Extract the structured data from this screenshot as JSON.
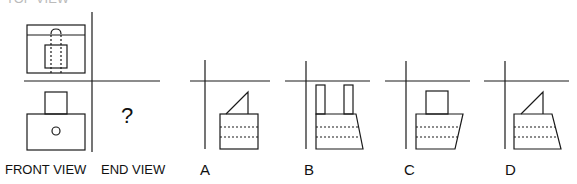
{
  "question": {
    "top_label": "TOP VIEW",
    "front_label": "FRONT VIEW",
    "end_label": "END VIEW",
    "unknown_marker": "?"
  },
  "options": [
    {
      "letter": "A",
      "description": "rectangle with two dashed hidden lines and a right-triangle on top"
    },
    {
      "letter": "B",
      "description": "trapezoid with two dashed hidden lines and two tall narrow rectangles on top"
    },
    {
      "letter": "C",
      "description": "trapezoid with two dashed hidden lines and a square on top"
    },
    {
      "letter": "D",
      "description": "trapezoid with two dashed hidden lines and a right-triangle on top"
    }
  ],
  "colors": {
    "line": "#1a1a1a",
    "background": "#ffffff"
  }
}
